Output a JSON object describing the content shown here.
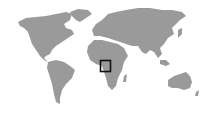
{
  "map": {
    "type": "world-locator-map",
    "land_color": "#9a9a9a",
    "background_color": "#ffffff",
    "continents": [
      "North America",
      "Greenland",
      "South America",
      "Europe",
      "Asia",
      "Africa",
      "Australia"
    ],
    "marker": {
      "shape": "square",
      "color": "#111111",
      "region": "Central Africa (Gulf of Guinea / Cameroon–Gabon area)",
      "x": 100,
      "y": 60,
      "width": 11,
      "height": 12
    }
  }
}
